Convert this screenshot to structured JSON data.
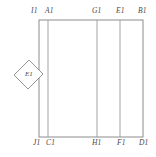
{
  "figure": {
    "background_color": "#ffffff",
    "line_color": "#8a8a8a",
    "text_color": "#4a4a4a"
  },
  "top_labels": [
    {
      "text": "I1",
      "x": 31,
      "name": "label-i1"
    },
    {
      "text": "A1",
      "x": 45,
      "name": "label-a1"
    },
    {
      "text": "G1",
      "x": 92,
      "name": "label-g1"
    },
    {
      "text": "E1",
      "x": 116,
      "name": "label-e1-top"
    },
    {
      "text": "B1",
      "x": 138,
      "name": "label-b1"
    }
  ],
  "bottom_labels": [
    {
      "text": "J1",
      "x": 33,
      "name": "label-j1"
    },
    {
      "text": "C1",
      "x": 46,
      "name": "label-c1"
    },
    {
      "text": "H1",
      "x": 92,
      "name": "label-h1"
    },
    {
      "text": "F1",
      "x": 117,
      "name": "label-f1"
    },
    {
      "text": "D1",
      "x": 139,
      "name": "label-d1"
    }
  ],
  "inset": {
    "label": "E1",
    "name": "rotated-square-e1"
  },
  "geometry": {
    "rect_left": 39,
    "rect_right": 143,
    "rect_top": 20,
    "rect_bottom": 137,
    "vertical_lines": [
      48,
      97,
      120
    ]
  }
}
